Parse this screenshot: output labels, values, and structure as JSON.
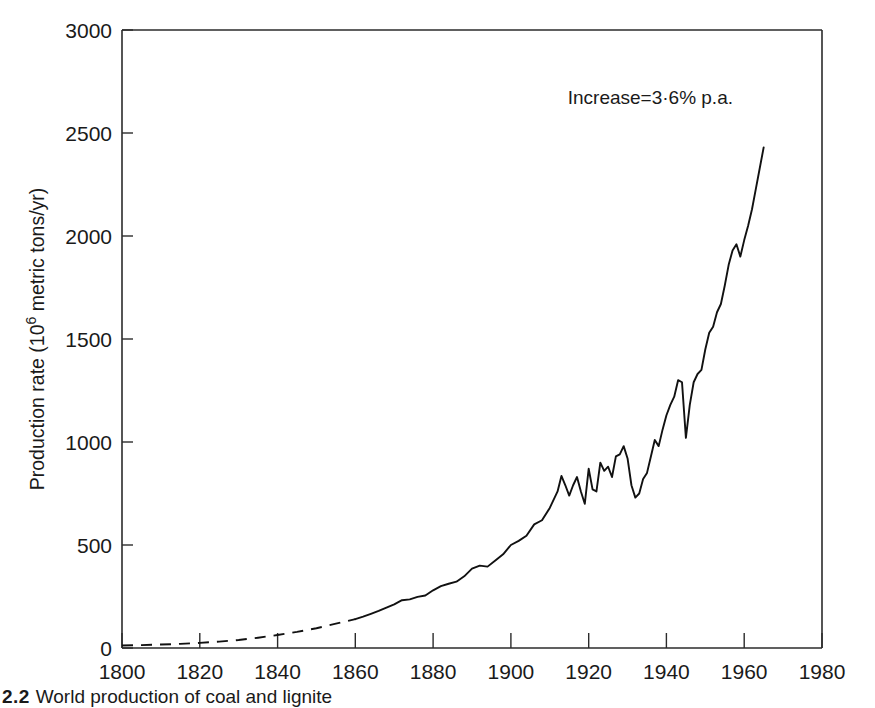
{
  "figure": {
    "caption_number": "2.2",
    "caption_body": "World production of coal and lignite"
  },
  "chart_data": {
    "type": "line",
    "title": "",
    "xlabel": "",
    "ylabel": "Production rate (10⁶ metric tons/yr)",
    "ylabel_plain": "Production rate (10^6 metric tons/yr)",
    "ylabel_parts": {
      "prefix": "Production rate (10",
      "exponent": "6",
      "suffix": " metric tons/yr)"
    },
    "xlim": [
      1800,
      1980
    ],
    "ylim": [
      0,
      3000
    ],
    "xticks": [
      1800,
      1820,
      1840,
      1860,
      1880,
      1900,
      1920,
      1940,
      1960,
      1980
    ],
    "yticks": [
      0,
      500,
      1000,
      1500,
      2000,
      2500,
      3000
    ],
    "grid": false,
    "legend": null,
    "annotations": [
      {
        "text": "Increase=3·6% p.a.",
        "text_plain": "Increase=3.6% p.a.",
        "x": 1950,
        "y": 2730
      }
    ],
    "line_color": "#111111",
    "segments": [
      {
        "name": "estimated (dashed)",
        "style": "dashed",
        "x": [
          1800,
          1805,
          1810,
          1815,
          1820,
          1825,
          1830,
          1835,
          1840,
          1845,
          1850,
          1855,
          1860
        ],
        "y": [
          12,
          14,
          17,
          20,
          25,
          31,
          39,
          50,
          63,
          78,
          96,
          118,
          140
        ]
      },
      {
        "name": "recorded (solid)",
        "style": "solid",
        "x": [
          1860,
          1862,
          1864,
          1866,
          1868,
          1870,
          1872,
          1874,
          1876,
          1878,
          1880,
          1882,
          1884,
          1886,
          1888,
          1890,
          1892,
          1894,
          1896,
          1898,
          1900,
          1902,
          1904,
          1906,
          1908,
          1910,
          1911,
          1912,
          1913,
          1914,
          1915,
          1916,
          1917,
          1918,
          1919,
          1920,
          1921,
          1922,
          1923,
          1924,
          1925,
          1926,
          1927,
          1928,
          1929,
          1930,
          1931,
          1932,
          1933,
          1934,
          1935,
          1936,
          1937,
          1938,
          1939,
          1940,
          1941,
          1942,
          1943,
          1944,
          1945,
          1946,
          1947,
          1948,
          1949,
          1950,
          1951,
          1952,
          1953,
          1954,
          1955,
          1956,
          1957,
          1958,
          1959,
          1960,
          1961,
          1962,
          1963,
          1964,
          1965
        ],
        "y": [
          140,
          152,
          166,
          180,
          196,
          212,
          232,
          236,
          248,
          255,
          280,
          300,
          312,
          322,
          348,
          385,
          400,
          395,
          425,
          455,
          500,
          520,
          545,
          600,
          620,
          680,
          720,
          760,
          835,
          790,
          740,
          790,
          830,
          760,
          700,
          870,
          770,
          760,
          900,
          860,
          880,
          830,
          930,
          940,
          980,
          920,
          790,
          730,
          750,
          820,
          850,
          930,
          1010,
          980,
          1060,
          1130,
          1180,
          1220,
          1300,
          1290,
          1020,
          1180,
          1290,
          1330,
          1350,
          1450,
          1530,
          1560,
          1630,
          1670,
          1760,
          1860,
          1930,
          1960,
          1900,
          1980,
          2050,
          2130,
          2230,
          2330,
          2430
        ]
      }
    ],
    "series_note": "Values in 10^6 metric tons per year; curve rises from near zero in 1800 to about 2800 in 1965."
  }
}
